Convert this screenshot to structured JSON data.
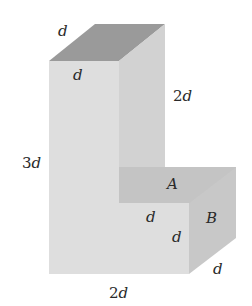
{
  "diagram": {
    "colors": {
      "front_face": "#dedede",
      "top_face": "#9a9a9a",
      "side_face": "#cdcdcd",
      "face_A": "#c4c4c4",
      "face_B": "#c8c8c8",
      "background": "#ffffff"
    },
    "labels": {
      "top_edge_depth": "d",
      "top_front_width": "d",
      "column_side_height": "2d",
      "total_height": "3d",
      "face_A": "A",
      "face_B": "B",
      "step_width": "d",
      "step_height": "d",
      "bottom_width": "2d",
      "bottom_depth": "d"
    }
  }
}
